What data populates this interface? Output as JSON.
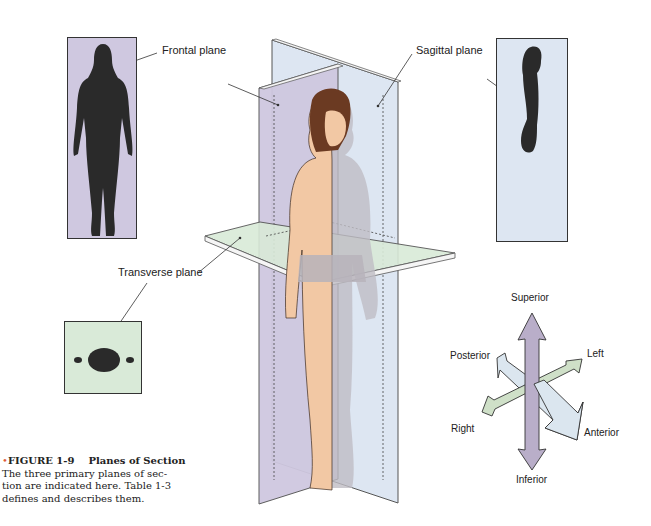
{
  "figure": {
    "number": "FIGURE 1-9",
    "title": "Planes of Section",
    "caption_lines": [
      "The three primary planes of sec-",
      "tion are indicated here. Table 1-3",
      "defines and describes them."
    ],
    "bullet": "•"
  },
  "planes": {
    "frontal": {
      "label": "Frontal plane",
      "color": "#cfc8e0"
    },
    "sagittal": {
      "label": "Sagittal plane",
      "color": "#dde6f2"
    },
    "transverse": {
      "label": "Transverse plane",
      "color": "#d9ead8"
    }
  },
  "directions": {
    "superior": "Superior",
    "inferior": "Inferior",
    "left": "Left",
    "right": "Right",
    "anterior": "Anterior",
    "posterior": "Posterior"
  },
  "colors": {
    "arrow_vertical": "#b9aec9",
    "arrow_lr": "#cfe0c8",
    "arrow_ap": "#dbe6ef",
    "skin": "#f2c8a4",
    "silhouette": "#2a2a2a"
  }
}
